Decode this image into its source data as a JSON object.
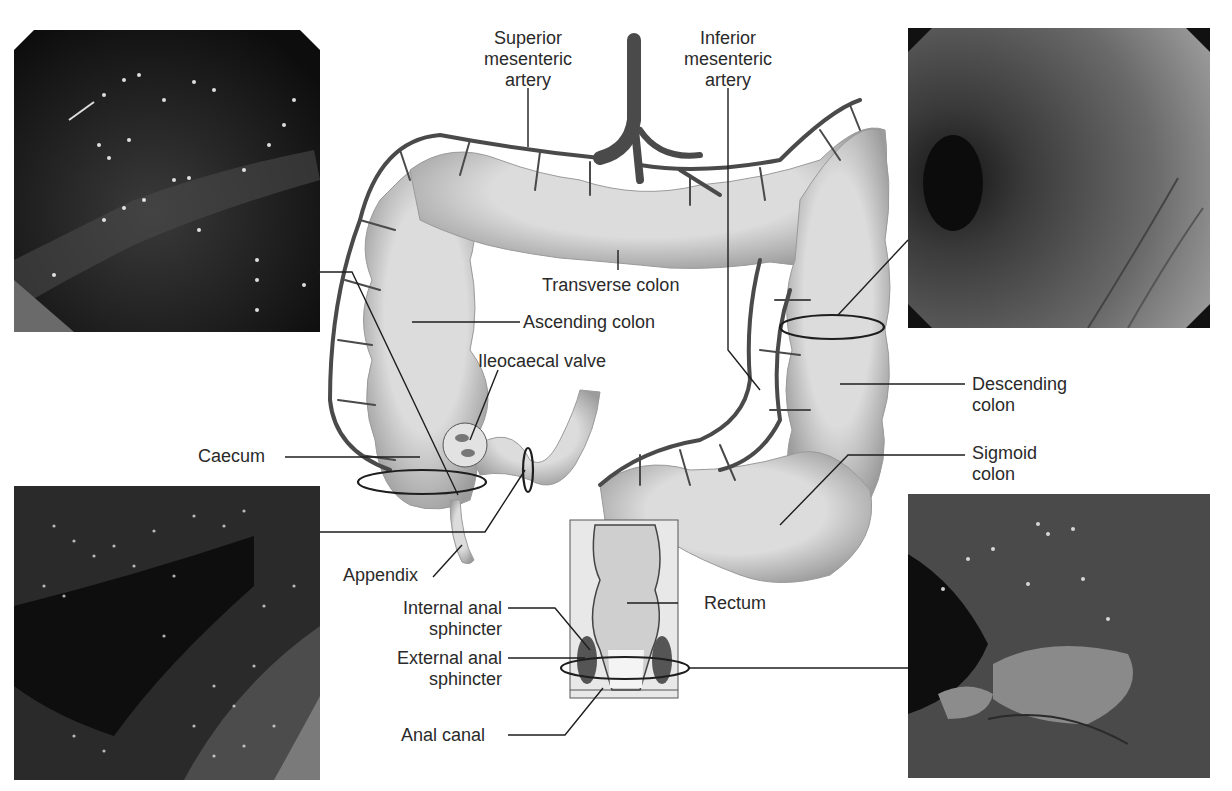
{
  "figure": {
    "colors": {
      "colon_fill": "#d6d6d6",
      "colon_shadow": "#8a8a8a",
      "artery": "#4a4a4a",
      "leader_line": "#1e1e1e",
      "photo_bg": "#1a1a1a"
    }
  },
  "labels": {
    "superior_mesenteric_artery": [
      "Superior",
      "mesenteric",
      "artery"
    ],
    "inferior_mesenteric_artery": [
      "Inferior",
      "mesenteric",
      "artery"
    ],
    "transverse_colon": "Transverse colon",
    "ascending_colon": "Ascending colon",
    "ileocaecal_valve": "Ileocaecal valve",
    "caecum": "Caecum",
    "appendix": "Appendix",
    "descending_colon": [
      "Descending",
      "colon"
    ],
    "sigmoid_colon": [
      "Sigmoid",
      "colon"
    ],
    "rectum": "Rectum",
    "internal_anal_sphincter": [
      "Internal anal",
      "sphincter"
    ],
    "external_anal_sphincter": [
      "External anal",
      "sphincter"
    ],
    "anal_canal": "Anal canal"
  },
  "photos": [
    {
      "position": "top-left",
      "depicts": "endoscopic view of ascending colon"
    },
    {
      "position": "bottom-left",
      "depicts": "endoscopic view of caecum / terminal ileum"
    },
    {
      "position": "top-right",
      "depicts": "endoscopic view of descending colon"
    },
    {
      "position": "bottom-right",
      "depicts": "endoscopic view of anal canal"
    }
  ]
}
